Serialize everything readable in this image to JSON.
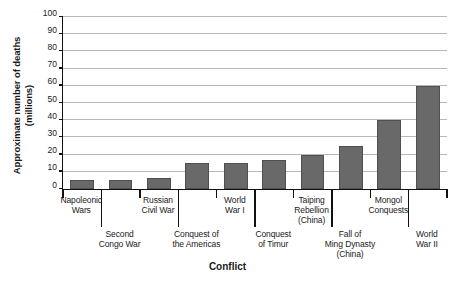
{
  "chart_data": {
    "type": "bar",
    "title": "",
    "xlabel": "Conflict",
    "ylabel": "Approximate number of deaths (millions)",
    "ylabel_line1": "Approximate number of deaths",
    "ylabel_line2": "(millions)",
    "ylim": [
      0,
      100
    ],
    "ytick_step": 10,
    "yticks": [
      "0",
      "10",
      "20",
      "30",
      "40",
      "50",
      "60",
      "70",
      "80",
      "90",
      "100"
    ],
    "grid": true,
    "legend": false,
    "bar_color": "#696969",
    "bar_edge_color": "#4f4f4f",
    "grid_color": "#b9b9b9",
    "axis_color": "#111111",
    "categories": [
      "Napoleonic Wars",
      "Second Congo War",
      "Russian Civil War",
      "Conquest of the Americas",
      "World War I",
      "Conquest of Timur",
      "Taiping Rebellion (China)",
      "Fall of Ming Dynasty (China)",
      "Mongol Conquests",
      "World War II"
    ],
    "category_label_lines": [
      [
        "Napoleonic",
        "Wars"
      ],
      [
        "Second",
        "Congo War"
      ],
      [
        "Russian",
        "Civil War"
      ],
      [
        "Conquest of",
        "the Americas"
      ],
      [
        "World",
        "War I"
      ],
      [
        "Conquest",
        "of Timur"
      ],
      [
        "Taiping",
        "Rebellion",
        "(China)"
      ],
      [
        "Fall of",
        "Ming Dynasty",
        "(China)"
      ],
      [
        "Mongol",
        "Conquests"
      ],
      [
        "World",
        "War II"
      ]
    ],
    "values": [
      5,
      5.4,
      6.5,
      15,
      15,
      17,
      20,
      25,
      40,
      60
    ]
  }
}
